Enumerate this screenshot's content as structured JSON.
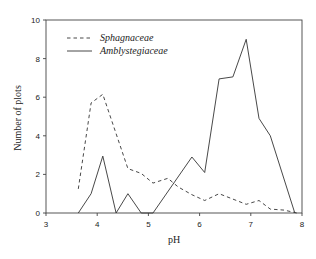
{
  "chart_data": {
    "type": "line",
    "title": "",
    "xlabel": "pH",
    "ylabel": "Number of plots",
    "xlim": [
      3,
      8
    ],
    "ylim": [
      0,
      10
    ],
    "xticks": [
      3,
      4,
      5,
      6,
      7,
      8
    ],
    "yticks": [
      0,
      2,
      4,
      6,
      8,
      10
    ],
    "grid": false,
    "frame": "box",
    "legend_position": "upper left",
    "series": [
      {
        "name": "Sphagnaceae",
        "style": "dashed",
        "color": "#333333",
        "x": [
          3.63,
          3.88,
          4.11,
          4.6,
          4.86,
          5.09,
          5.38,
          5.58,
          5.85,
          6.1,
          6.38,
          6.91,
          7.16,
          7.38,
          7.65,
          7.9
        ],
        "y": [
          1.25,
          5.7,
          6.15,
          2.3,
          2.05,
          1.55,
          1.8,
          1.35,
          0.95,
          0.65,
          1.0,
          0.45,
          0.65,
          0.2,
          0.15,
          0
        ]
      },
      {
        "name": "Amblystegiaceae",
        "style": "solid",
        "color": "#333333",
        "x": [
          3.63,
          3.88,
          4.11,
          4.37,
          4.6,
          4.86,
          5.09,
          5.85,
          6.1,
          6.38,
          6.65,
          6.91,
          7.16,
          7.38,
          7.86
        ],
        "y": [
          0,
          1.0,
          2.95,
          0,
          1.0,
          0,
          0,
          2.9,
          2.1,
          6.95,
          7.05,
          9.0,
          4.9,
          4.0,
          0
        ]
      }
    ]
  }
}
